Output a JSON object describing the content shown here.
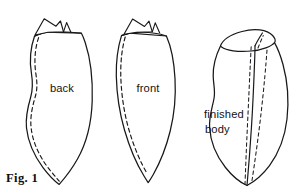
{
  "figure": {
    "caption": "Fig. 1",
    "background_color": "#ffffff",
    "ink_color": "#17181a",
    "type": "line-drawing"
  },
  "parts": [
    {
      "id": "back",
      "label": "back",
      "label_x": 62,
      "label_y": 92,
      "description": "flat pattern piece, leaf shape with wavy left edge, triangular notch flap at top, dashed seam allowance inside left edge"
    },
    {
      "id": "front",
      "label": "front",
      "label_x": 148,
      "label_y": 92,
      "description": "flat pattern piece, narrow symmetric leaf shape, triangular notch flap at top, dashed seam allowance inside left edge"
    },
    {
      "id": "finished-body",
      "label_line1": "finished",
      "label_line2": "body",
      "label_x": 224,
      "label_y": 118,
      "description": "three dimensional assembled body with elliptical opening at top and center seam flanked by dashed stitch lines"
    }
  ],
  "geometry": {
    "back": {
      "outline": "M 34.5 36.2 C 30.0 49.0 29.6 62.0 31.4 73.0 C 33.0 83.0 33.2 88.8 30.6 97.5 C 27.8 107.0 25.3 117.0 26.5 128.0 C 28.0 141.5 34.0 155.5 43.0 167.5 C 50.0 176.8 56.0 182.0 59.2 184.4 C 62.2 181.0 70.5 171.5 77.5 159.0 C 86.5 143.0 91.5 123.0 92.2 101.0 C 92.9 79.0 90.0 57.0 85.2 42.5 C 83.6 37.6 82.2 34.6 81.4 33.2 L 45.0 32.2 Z",
      "top_edge": "M 34.5 36.2 C 38.0 34.2 42.5 32.9 48.0 32.3 C 58.0 31.3 70.0 31.6 81.4 33.2",
      "flap": "M 35.0 35.0 L 44.2 18.8 L 56.0 26.2 L 60.5 21.0 L 63.5 31.9 L 48.0 32.3 Z",
      "flap_right": "M 63.5 31.9 L 66.6 22.6 L 71.0 32.4",
      "seam": "M 38.6 37.6 C 34.6 49.5 34.2 62.5 35.8 73.2 C 37.3 83.3 37.5 89.0 35.0 97.6 C 32.3 107.0 30.0 117.0 31.1 127.6 C 32.5 140.6 38.2 154.2 46.8 166.0 C 52.6 174.0 57.3 178.6 59.2 181.2"
    },
    "front": {
      "outline": "M 121.5 35.6 C 117.5 48.5 116.0 62.0 116.3 76.0 C 116.7 93.0 119.3 112.0 124.5 130.0 C 130.0 149.0 137.5 165.5 144.0 176.0 C 146.0 179.3 147.4 181.4 148.2 182.6 C 149.2 181.2 151.0 178.6 153.3 174.5 C 159.5 163.5 166.0 148.0 170.2 131.0 C 174.3 114.5 176.0 96.0 175.0 78.5 C 174.0 60.5 170.6 45.5 166.4 36.0 L 130.0 33.2 Z",
      "top_edge": "M 121.5 35.6 C 125.5 33.8 130.5 32.7 136.5 32.4 C 147.0 31.9 157.5 33.0 166.4 36.0",
      "flap": "M 124.0 34.2 L 132.6 19.0 L 144.5 26.5 L 149.0 21.2 L 152.3 31.8 L 136.5 32.4 Z",
      "flap_right": "M 152.3 31.8 L 155.2 22.8 L 159.6 32.8",
      "seam": "M 125.2 37.0 C 121.7 49.4 120.5 62.4 120.8 76.0 C 121.2 92.7 123.7 111.3 128.7 129.0 C 134.0 147.6 141.2 163.7 147.4 174.0"
    },
    "finished_body": {
      "outline": "M 220.5 46.0 C 215.5 56.0 213.0 66.5 213.2 76.0 C 213.4 85.0 215.5 90.5 214.0 98.5 C 212.5 107.0 209.0 116.0 209.6 127.0 C 210.3 140.5 216.0 155.5 225.5 167.5 C 233.0 177.0 241.5 183.0 247.0 185.5 C 252.5 182.5 262.0 175.5 269.5 165.5 C 279.0 152.8 285.0 136.5 287.0 119.0 C 289.0 101.0 287.5 81.0 283.0 64.5 C 280.4 55.0 277.3 47.5 274.5 42.6",
      "opening": "M 220.5 46.0 C 222.5 40.0 231.0 34.5 242.0 31.5 C 254.5 28.0 267.0 29.5 272.6 35.5 C 275.5 38.6 275.8 41.0 274.5 42.6 C 271.5 46.4 262.0 50.0 251.5 51.0 C 238.0 52.3 226.0 50.5 221.6 47.0 Z",
      "ridge": "M 247.0 185.5 C 248.4 170.0 250.0 150.0 251.4 128.0 C 253.0 103.5 254.0 78.0 254.6 61.5 C 254.9 53.8 255.0 48.5 255.0 45.8",
      "ridge_in_opening": "M 255.0 45.8 C 256.5 42.5 259.5 37.5 262.4 33.0",
      "seam_left": "M 245.0 184.5 C 245.6 168.0 246.4 148.0 247.4 126.5 C 248.6 102.0 249.6 77.5 250.4 62.0 C 250.8 54.5 251.0 49.0 251.2 46.4",
      "seam_right": "M 252.0 180.5 C 254.4 165.0 257.2 145.0 259.8 124.0 C 262.6 101.0 264.8 78.0 266.0 63.0 C 266.6 55.5 267.0 50.2 267.2 47.4",
      "seam_right_inner": "M 258.0 48.0 C 259.6 44.0 261.5 39.5 263.2 35.6"
    }
  }
}
